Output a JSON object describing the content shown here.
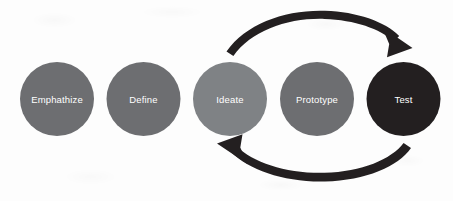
{
  "diagram": {
    "type": "process-cycle",
    "background_color": "#fdfdfd",
    "arrow_color": "#231f20",
    "label_color": "#ffffff",
    "stages": [
      {
        "id": "emphathize",
        "label": "Emphathize",
        "color": "#6d6e71",
        "cx": 57,
        "cy": 99,
        "r": 37
      },
      {
        "id": "define",
        "label": "Define",
        "color": "#6d6e71",
        "cx": 143.5,
        "cy": 99,
        "r": 37
      },
      {
        "id": "ideate",
        "label": "Ideate",
        "color": "#7f8285",
        "cx": 230,
        "cy": 99,
        "r": 37
      },
      {
        "id": "prototype",
        "label": "Prototype",
        "color": "#6d6e71",
        "cx": 317,
        "cy": 99,
        "r": 37
      },
      {
        "id": "test",
        "label": "Test",
        "color": "#231f20",
        "cx": 403.5,
        "cy": 99,
        "r": 37
      }
    ],
    "arrows": [
      {
        "id": "forward-loop",
        "name": "top-curved-arrow",
        "from": "ideate",
        "to": "test",
        "direction": "left-to-right"
      },
      {
        "id": "feedback-loop",
        "name": "bottom-curved-arrow",
        "from": "test",
        "to": "ideate",
        "direction": "right-to-left"
      }
    ]
  }
}
